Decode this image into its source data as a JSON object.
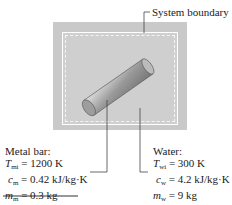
{
  "boundary_label": "System boundary",
  "metal": {
    "title": "Metal bar:",
    "T_sym": "T",
    "T_sub": "mi",
    "T_val": " = 1200 K",
    "c_sym": "c",
    "c_sub": "m",
    "c_val": " = 0.42 kJ/kg·K",
    "m_sym": "m",
    "m_sub": "m",
    "m_val": " = 0.3 kg"
  },
  "water": {
    "title": "Water:",
    "T_sym": "T",
    "T_sub": "wi",
    "T_val": " = 300 K",
    "c_sym": "c",
    "c_sub": "w",
    "c_val": " = 4.2 kJ/kg·K",
    "m_sym": "m",
    "m_sub": "w",
    "m_val": " = 9 kg"
  },
  "colors": {
    "tank": "#c9c9c9",
    "water": "#cfcfcf",
    "bar": "#a8a8a8"
  }
}
